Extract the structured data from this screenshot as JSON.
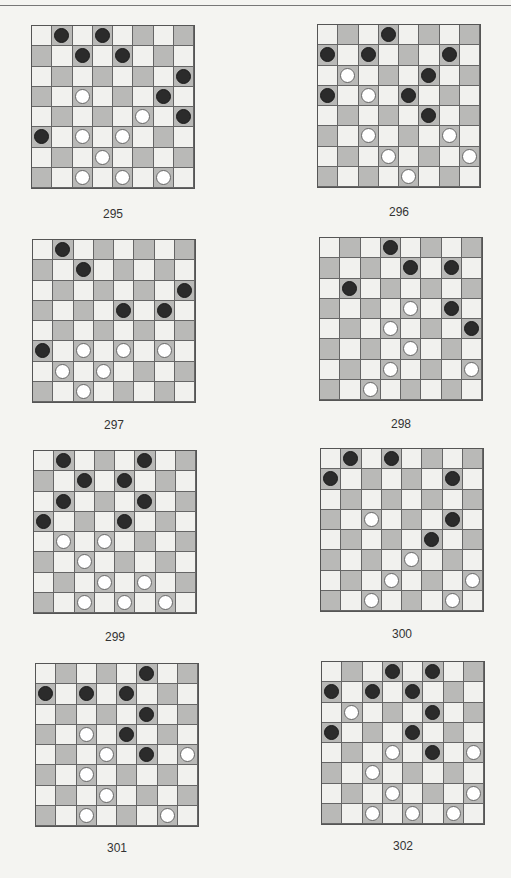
{
  "colors": {
    "light_square": "#f1f1ee",
    "dark_square": "#b9b9b7",
    "black_piece": "#2b2b2b",
    "white_piece": "#ffffff"
  },
  "boards": [
    {
      "label": "295",
      "x": 31,
      "y": 25,
      "lx": 31,
      "ly": 207,
      "black": [
        [
          0,
          1
        ],
        [
          0,
          3
        ],
        [
          1,
          2
        ],
        [
          1,
          4
        ],
        [
          2,
          7
        ],
        [
          3,
          6
        ],
        [
          4,
          7
        ],
        [
          5,
          0
        ]
      ],
      "white": [
        [
          3,
          2
        ],
        [
          4,
          5
        ],
        [
          5,
          2
        ],
        [
          5,
          4
        ],
        [
          6,
          3
        ],
        [
          7,
          2
        ],
        [
          7,
          4
        ],
        [
          7,
          6
        ]
      ]
    },
    {
      "label": "296",
      "x": 317,
      "y": 24,
      "lx": 317,
      "ly": 205,
      "black": [
        [
          0,
          3
        ],
        [
          1,
          0
        ],
        [
          1,
          2
        ],
        [
          1,
          6
        ],
        [
          2,
          5
        ],
        [
          3,
          0
        ],
        [
          3,
          4
        ],
        [
          4,
          5
        ]
      ],
      "white": [
        [
          2,
          1
        ],
        [
          3,
          2
        ],
        [
          5,
          2
        ],
        [
          5,
          6
        ],
        [
          6,
          3
        ],
        [
          6,
          7
        ],
        [
          7,
          4
        ]
      ]
    },
    {
      "label": "297",
      "x": 32,
      "y": 239,
      "lx": 32,
      "ly": 418,
      "black": [
        [
          0,
          1
        ],
        [
          1,
          2
        ],
        [
          2,
          7
        ],
        [
          3,
          4
        ],
        [
          3,
          6
        ],
        [
          5,
          0
        ]
      ],
      "white": [
        [
          5,
          2
        ],
        [
          5,
          4
        ],
        [
          5,
          6
        ],
        [
          6,
          1
        ],
        [
          6,
          3
        ],
        [
          7,
          2
        ]
      ]
    },
    {
      "label": "298",
      "x": 319,
      "y": 237,
      "lx": 319,
      "ly": 417,
      "black": [
        [
          0,
          3
        ],
        [
          1,
          4
        ],
        [
          1,
          6
        ],
        [
          2,
          1
        ],
        [
          3,
          6
        ],
        [
          4,
          7
        ]
      ],
      "white": [
        [
          3,
          4
        ],
        [
          4,
          3
        ],
        [
          5,
          4
        ],
        [
          6,
          3
        ],
        [
          6,
          7
        ],
        [
          7,
          2
        ]
      ]
    },
    {
      "label": "299",
      "x": 33,
      "y": 450,
      "lx": 33,
      "ly": 630,
      "black": [
        [
          0,
          1
        ],
        [
          0,
          5
        ],
        [
          1,
          2
        ],
        [
          1,
          4
        ],
        [
          2,
          1
        ],
        [
          2,
          5
        ],
        [
          3,
          0
        ],
        [
          3,
          4
        ]
      ],
      "white": [
        [
          4,
          1
        ],
        [
          4,
          3
        ],
        [
          5,
          2
        ],
        [
          6,
          3
        ],
        [
          6,
          5
        ],
        [
          7,
          2
        ],
        [
          7,
          4
        ],
        [
          7,
          6
        ]
      ]
    },
    {
      "label": "300",
      "x": 320,
      "y": 448,
      "lx": 320,
      "ly": 627,
      "black": [
        [
          0,
          1
        ],
        [
          0,
          3
        ],
        [
          1,
          0
        ],
        [
          1,
          6
        ],
        [
          3,
          6
        ],
        [
          4,
          5
        ]
      ],
      "white": [
        [
          3,
          2
        ],
        [
          5,
          4
        ],
        [
          6,
          3
        ],
        [
          6,
          7
        ],
        [
          7,
          2
        ],
        [
          7,
          6
        ]
      ]
    },
    {
      "label": "301",
      "x": 35,
      "y": 663,
      "lx": 35,
      "ly": 841,
      "black": [
        [
          0,
          5
        ],
        [
          1,
          0
        ],
        [
          1,
          2
        ],
        [
          1,
          4
        ],
        [
          2,
          5
        ],
        [
          3,
          4
        ],
        [
          4,
          5
        ]
      ],
      "white": [
        [
          3,
          2
        ],
        [
          4,
          3
        ],
        [
          4,
          7
        ],
        [
          5,
          2
        ],
        [
          6,
          3
        ],
        [
          7,
          2
        ],
        [
          7,
          6
        ]
      ]
    },
    {
      "label": "302",
      "x": 321,
      "y": 661,
      "lx": 321,
      "ly": 839,
      "black": [
        [
          0,
          3
        ],
        [
          0,
          5
        ],
        [
          1,
          0
        ],
        [
          1,
          2
        ],
        [
          1,
          4
        ],
        [
          2,
          5
        ],
        [
          3,
          0
        ],
        [
          3,
          4
        ],
        [
          4,
          5
        ]
      ],
      "white": [
        [
          2,
          1
        ],
        [
          4,
          3
        ],
        [
          4,
          7
        ],
        [
          5,
          2
        ],
        [
          6,
          3
        ],
        [
          6,
          7
        ],
        [
          7,
          2
        ],
        [
          7,
          4
        ],
        [
          7,
          6
        ]
      ]
    }
  ]
}
